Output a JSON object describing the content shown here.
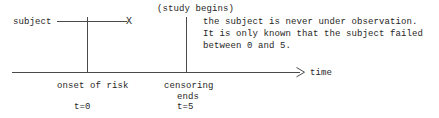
{
  "diagram": {
    "axis": {
      "label": "time",
      "arrow_icon": "arrow-right-icon"
    },
    "subject": {
      "label": "subject",
      "failure_marker": "X"
    },
    "annotations": {
      "study_begins": "(study begins)",
      "note_line_1": "the subject is never under observation.",
      "note_line_2": "It is only known that the subject failed",
      "note_line_3": "between 0 and 5."
    },
    "events": [
      {
        "name": "onset-of-risk",
        "label": "onset of risk",
        "time_label": "t=0"
      },
      {
        "name": "censoring-ends",
        "label_line_1": "censoring",
        "label_line_2": "ends",
        "time_label": "t=5"
      }
    ],
    "colors": {
      "background": "#ffffff",
      "line": "#4a4a4a",
      "text": "#262626"
    }
  }
}
